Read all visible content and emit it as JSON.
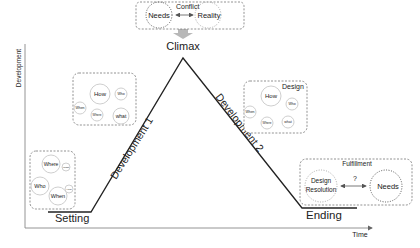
{
  "axes": {
    "y_label": "Development",
    "x_label": "Time"
  },
  "stages": {
    "setting": "Setting",
    "development1": "Development 1",
    "climax": "Climax",
    "development2": "Development 2",
    "ending": "Ending"
  },
  "conflict_box": {
    "title": "Conflict",
    "left": "Needs",
    "right": "Reality",
    "connector": "↔"
  },
  "setting_box": {
    "circles": [
      "Where",
      "What",
      "Who",
      "When",
      "How"
    ]
  },
  "development1_box": {
    "circles": [
      "How",
      "Who",
      "When",
      "Where",
      "what"
    ]
  },
  "design_box": {
    "title": "Design",
    "circles": [
      "How",
      "Who",
      "When",
      "Where",
      "what"
    ]
  },
  "fulfillment_box": {
    "title": "Fulfillment",
    "left_line1": "Design",
    "left_line2": "Resolution",
    "question": "?",
    "right": "Needs"
  },
  "colors": {
    "line": "#222222",
    "axis": "#888888",
    "arrow": "#b0b0b0",
    "box_border": "#777777"
  }
}
